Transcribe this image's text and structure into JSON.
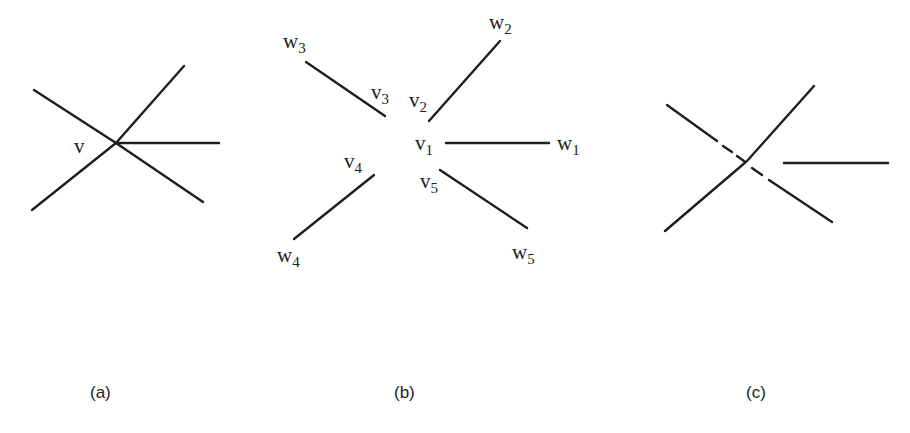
{
  "figure": {
    "panels": [
      {
        "id": "a",
        "caption": "(a)",
        "vertex_label": "v",
        "description": "A single vertex v with five incident edges"
      },
      {
        "id": "b",
        "caption": "(b)",
        "description": "Vertex v split into five vertices v1..v5, each attached to one neighbor w1..w5",
        "edges": [
          {
            "v": "v",
            "v_sub": "1",
            "w": "w",
            "w_sub": "1"
          },
          {
            "v": "v",
            "v_sub": "2",
            "w": "w",
            "w_sub": "2"
          },
          {
            "v": "v",
            "v_sub": "3",
            "w": "w",
            "w_sub": "3"
          },
          {
            "v": "v",
            "v_sub": "4",
            "w": "w",
            "w_sub": "4"
          },
          {
            "v": "v",
            "v_sub": "5",
            "w": "w",
            "w_sub": "5"
          }
        ]
      },
      {
        "id": "c",
        "caption": "(c)",
        "description": "Crossing drawing with dashed segments near the center and a detached horizontal edge"
      }
    ]
  },
  "colors": {
    "stroke": "#1e1e1e",
    "background": "#ffffff"
  }
}
